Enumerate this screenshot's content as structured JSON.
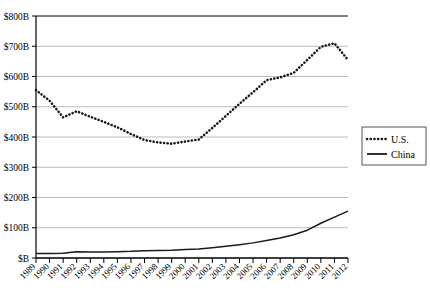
{
  "chart_data": {
    "type": "line",
    "title": "",
    "subtitle": "",
    "xlabel": "",
    "ylabel": "",
    "x": [
      1989,
      1990,
      1991,
      1992,
      1993,
      1994,
      1995,
      1996,
      1997,
      1998,
      1999,
      2000,
      2001,
      2002,
      2003,
      2004,
      2005,
      2006,
      2007,
      2008,
      2009,
      2010,
      2011,
      2012
    ],
    "categories": [
      "1989",
      "1990",
      "1991",
      "1992",
      "1993",
      "1994",
      "1995",
      "1996",
      "1997",
      "1998",
      "1999",
      "2000",
      "2001",
      "2002",
      "2003",
      "2004",
      "2005",
      "2006",
      "2007",
      "2008",
      "2009",
      "2010",
      "2011",
      "2012"
    ],
    "series": [
      {
        "name": "U.S.",
        "style": "dotted",
        "color": "#1a1a1a",
        "values": [
          555,
          520,
          465,
          485,
          467,
          450,
          432,
          410,
          390,
          382,
          378,
          385,
          392,
          430,
          470,
          510,
          548,
          588,
          597,
          612,
          655,
          698,
          710,
          655
        ]
      },
      {
        "name": "China",
        "style": "solid",
        "color": "#1a1a1a",
        "values": [
          15,
          15,
          16,
          21,
          20,
          20,
          21,
          22,
          24,
          25,
          26,
          28,
          30,
          34,
          39,
          44,
          50,
          58,
          66,
          77,
          92,
          115,
          135,
          155
        ]
      }
    ],
    "ylim": [
      0,
      800
    ],
    "yticks": [
      0,
      100,
      200,
      300,
      400,
      500,
      600,
      700,
      800
    ],
    "ytick_labels": [
      "$B",
      "$100B",
      "$200B",
      "$300B",
      "$400B",
      "$500B",
      "$600B",
      "$700B",
      "$800B"
    ],
    "grid": true,
    "grid_axis": "y",
    "legend_position": "right",
    "legend_entries": [
      "U.S.",
      "China"
    ]
  },
  "legend": {
    "items": [
      {
        "label": "U.S.",
        "marker": "dotted-line-marker"
      },
      {
        "label": "China",
        "marker": "solid-line-marker"
      }
    ]
  },
  "colors": {
    "axis": "#000000",
    "gridline": "#aaaaaa",
    "series_us": "#1a1a1a",
    "series_china": "#1a1a1a",
    "background": "#ffffff",
    "legend_border": "#555555"
  }
}
